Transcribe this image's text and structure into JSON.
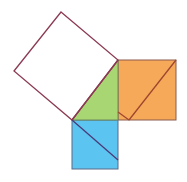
{
  "diagram": {
    "colors": {
      "outline": "#8B3A52",
      "hypotenuse_square": "#ffffff",
      "triangle": "#A8D672",
      "leg_a_square": "#F7A95A",
      "leg_b_square": "#5CC4F0"
    },
    "shapes": {
      "hypotenuse_square": "61,12 118,60 72,120 14,71",
      "triangle": "118,60 118,120 72,120",
      "leg_a_square": {
        "x": 118,
        "y": 60,
        "w": 58,
        "h": 60
      },
      "leg_b_square": {
        "x": 72,
        "y": 120,
        "w": 46,
        "h": 49
      }
    },
    "cuts": [
      {
        "x1": 176,
        "y1": 60,
        "x2": 129,
        "y2": 120
      },
      {
        "x1": 118,
        "y1": 112,
        "x2": 129,
        "y2": 120
      },
      {
        "x1": 72,
        "y1": 120,
        "x2": 118,
        "y2": 160
      }
    ]
  }
}
